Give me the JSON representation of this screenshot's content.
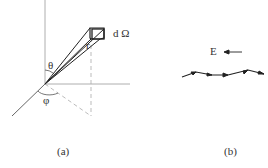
{
  "panel_a": {
    "caption": "(a)",
    "labels": {
      "r": "r",
      "theta": "θ",
      "phi": "φ",
      "solid_angle": "d Ω"
    }
  },
  "panel_b": {
    "caption": "(b)",
    "labels": {
      "field": "E"
    }
  },
  "colors": {
    "stroke": "#222222",
    "dashed": "#999999",
    "text": "#333333"
  }
}
